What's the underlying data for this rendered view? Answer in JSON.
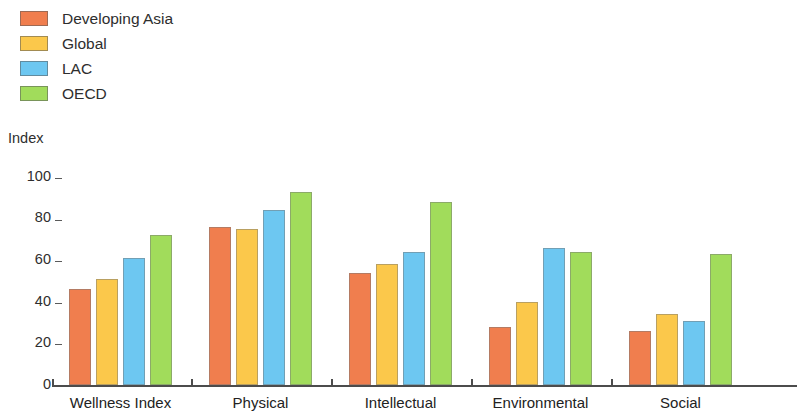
{
  "chart_data": {
    "type": "bar",
    "title": "",
    "xlabel": "",
    "ylabel": "Index",
    "ylim": [
      0,
      100
    ],
    "yticks": [
      0,
      20,
      40,
      60,
      80,
      100
    ],
    "grid": false,
    "legend_position": "top-left",
    "categories": [
      "Wellness Index",
      "Physical",
      "Intellectual",
      "Environmental",
      "Social"
    ],
    "series": [
      {
        "name": "Developing Asia",
        "color": "#F07E4E",
        "values": [
          46,
          76,
          54,
          28,
          26
        ]
      },
      {
        "name": "Global",
        "color": "#FBC84B",
        "values": [
          51,
          75,
          58,
          40,
          34
        ]
      },
      {
        "name": "LAC",
        "color": "#6DC7F1",
        "values": [
          61,
          84,
          64,
          66,
          31
        ]
      },
      {
        "name": "OECD",
        "color": "#A1DC5B",
        "values": [
          72,
          93,
          88,
          64,
          63
        ]
      }
    ]
  },
  "axis": {
    "y_title": "Index",
    "tick_labels": [
      "100",
      "80",
      "60",
      "40",
      "20",
      "0"
    ]
  }
}
